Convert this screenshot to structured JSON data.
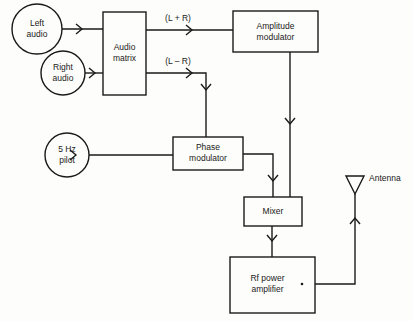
{
  "diagram": {
    "title": "",
    "nodes": [
      {
        "id": "left_audio",
        "shape": "circle",
        "label": "Left\naudio"
      },
      {
        "id": "right_audio",
        "shape": "circle",
        "label": "Right\naudio"
      },
      {
        "id": "audio_matrix",
        "shape": "box",
        "label": "Audio\nmatrix"
      },
      {
        "id": "amplitude_modulator",
        "shape": "box",
        "label": "Amplitude\nmodulator"
      },
      {
        "id": "pilot",
        "shape": "circle",
        "label": "5 Hz\npilot"
      },
      {
        "id": "phase_modulator",
        "shape": "box",
        "label": "Phase\nmodulator"
      },
      {
        "id": "mixer",
        "shape": "box",
        "label": "Mixer"
      },
      {
        "id": "rf_amp",
        "shape": "box",
        "label": "Rf power\namplifier"
      },
      {
        "id": "antenna",
        "shape": "antenna",
        "label": "Antenna"
      }
    ],
    "edges": [
      {
        "from": "left_audio",
        "to": "audio_matrix",
        "label": ""
      },
      {
        "from": "right_audio",
        "to": "audio_matrix",
        "label": ""
      },
      {
        "from": "audio_matrix",
        "to": "amplitude_modulator",
        "label": "(L + R)"
      },
      {
        "from": "audio_matrix",
        "to": "phase_modulator",
        "label": "(L – R)"
      },
      {
        "from": "pilot",
        "to": "phase_modulator",
        "label": ""
      },
      {
        "from": "amplitude_modulator",
        "to": "mixer",
        "label": ""
      },
      {
        "from": "phase_modulator",
        "to": "mixer",
        "label": ""
      },
      {
        "from": "mixer",
        "to": "rf_amp",
        "label": ""
      },
      {
        "from": "rf_amp",
        "to": "antenna",
        "label": ""
      }
    ]
  }
}
